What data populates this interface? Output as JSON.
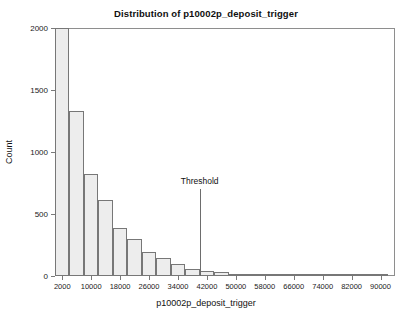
{
  "chart_data": {
    "type": "bar",
    "title": "Distribution of p10002p_deposit_trigger",
    "xlabel": "p10002p_deposit_trigger",
    "ylabel": "Count",
    "subtitle": "",
    "grid": false,
    "legend": "none",
    "xlim": [
      0,
      94000
    ],
    "ylim": [
      0,
      2000
    ],
    "bin_width": 4000,
    "bin_starts": [
      0,
      4000,
      8000,
      12000,
      16000,
      20000,
      24000,
      28000,
      32000,
      36000,
      40000,
      44000,
      48000,
      52000,
      56000,
      60000,
      64000,
      68000,
      72000,
      76000,
      80000,
      84000,
      88000
    ],
    "categories": [
      "0-4000",
      "4000-8000",
      "8000-12000",
      "12000-16000",
      "16000-20000",
      "20000-24000",
      "24000-28000",
      "28000-32000",
      "32000-36000",
      "36000-40000",
      "40000-44000",
      "44000-48000",
      "48000-52000",
      "52000-56000",
      "56000-60000",
      "60000-64000",
      "64000-68000",
      "68000-72000",
      "72000-76000",
      "76000-80000",
      "80000-84000",
      "84000-88000",
      "88000-92000"
    ],
    "values": [
      2000,
      1330,
      820,
      610,
      390,
      295,
      195,
      145,
      95,
      60,
      42,
      30,
      20,
      14,
      9,
      6,
      4,
      3,
      2,
      1,
      1,
      0,
      0
    ],
    "xticks": [
      2000,
      10000,
      18000,
      26000,
      34000,
      42000,
      50000,
      58000,
      66000,
      74000,
      82000,
      90000
    ],
    "xtick_labels": [
      "2000",
      "10000",
      "18000",
      "26000",
      "34000",
      "42000",
      "50000",
      "58000",
      "66000",
      "74000",
      "82000",
      "90000"
    ],
    "yticks": [
      0,
      500,
      1000,
      1500,
      2000
    ],
    "ytick_labels": [
      "0",
      "500",
      "1000",
      "1500",
      "2000"
    ],
    "annotations": [
      {
        "name": "threshold",
        "label": "Threshold",
        "x": 40000,
        "label_y": 700,
        "line_top_y": 700
      }
    ],
    "bar_fill": "#ededed",
    "bar_edge": "#777777",
    "axis_color": "#8e8e8e",
    "text_color": "#1a1a1a"
  }
}
